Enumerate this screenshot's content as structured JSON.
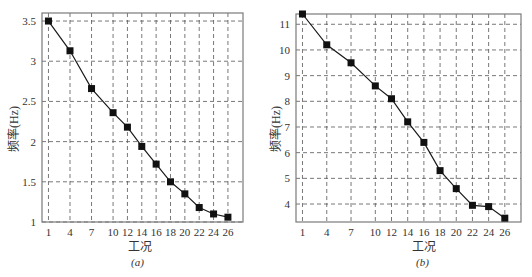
{
  "chart_data": [
    {
      "type": "line",
      "panel": "(a)",
      "title": "",
      "xlabel": "工况",
      "ylabel": "频率(Hz)",
      "x": [
        1,
        4,
        7,
        10,
        12,
        14,
        16,
        18,
        20,
        22,
        24,
        26
      ],
      "series": [
        {
          "name": "frequency",
          "marker": "square",
          "values": [
            3.5,
            3.13,
            2.66,
            2.36,
            2.18,
            1.94,
            1.72,
            1.5,
            1.35,
            1.18,
            1.1,
            1.06
          ]
        }
      ],
      "xticks": [
        "1",
        "4",
        "7",
        "10",
        "12",
        "14",
        "16",
        "18",
        "20",
        "22",
        "24",
        "26"
      ],
      "yticks": [
        "1",
        "1.5",
        "2",
        "2.5",
        "3",
        "3.5"
      ],
      "ytick_values": [
        1,
        1.5,
        2,
        2.5,
        3,
        3.5
      ],
      "ylim": [
        1,
        3.6
      ],
      "xlim": [
        0.1,
        28.1
      ],
      "grid": true
    },
    {
      "type": "line",
      "panel": "(b)",
      "title": "",
      "xlabel": "工况",
      "ylabel": "频率(Hz)",
      "x": [
        1,
        4,
        7,
        10,
        12,
        14,
        16,
        18,
        20,
        22,
        24,
        26
      ],
      "series": [
        {
          "name": "frequency",
          "marker": "square",
          "values": [
            11.4,
            10.2,
            9.5,
            8.6,
            8.1,
            7.2,
            6.4,
            5.3,
            4.6,
            3.95,
            3.9,
            3.45
          ]
        }
      ],
      "xticks": [
        "1",
        "4",
        "7",
        "10",
        "12",
        "14",
        "16",
        "18",
        "20",
        "22",
        "24",
        "26"
      ],
      "yticks": [
        "4",
        "5",
        "6",
        "7",
        "8",
        "9",
        "10",
        "11"
      ],
      "ytick_values": [
        4,
        5,
        6,
        7,
        8,
        9,
        10,
        11
      ],
      "ylim": [
        3.3,
        11.4
      ],
      "xlim": [
        0.2,
        28
      ],
      "grid": true
    }
  ],
  "panels": {
    "a": {
      "caption": "(a)",
      "xlabel": "工况",
      "ylabel": "频率(Hz)"
    },
    "b": {
      "caption": "(b)",
      "xlabel": "工况",
      "ylabel": "频率(Hz)"
    }
  }
}
